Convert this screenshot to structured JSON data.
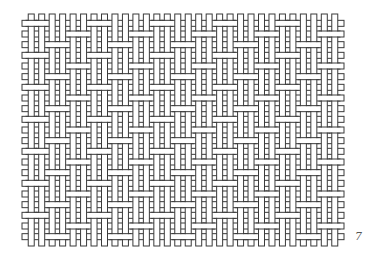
{
  "figure": {
    "page_number": "7",
    "stroke_color": "#3a3a3a",
    "fill_color": "#ffffff",
    "area": {
      "x0": 26,
      "y0": 18,
      "x1": 340,
      "y1": 242
    },
    "cols": 30,
    "rows": 21,
    "strip_width": 6
  }
}
